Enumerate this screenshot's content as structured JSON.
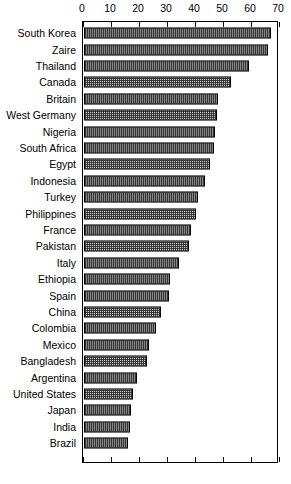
{
  "chart_data": {
    "type": "bar",
    "orientation": "horizontal",
    "title": "",
    "subtitle": "",
    "xlabel": "",
    "ylabel": "",
    "xlim": [
      0,
      70
    ],
    "ylim": null,
    "grid": false,
    "legend": null,
    "legend_position": "none",
    "axis_ticks_top": [
      0,
      10,
      20,
      30,
      40,
      50,
      60,
      70
    ],
    "axis_ticks_bottom_labeled": false,
    "tick_labels": [
      "0",
      "10",
      "20",
      "30",
      "40",
      "50",
      "60",
      "70"
    ],
    "bar_fill_color": "#c9c9c9",
    "bar_edge_color": "#000000",
    "categories": [
      "South Korea",
      "Zaire",
      "Thailand",
      "Canada",
      "Britain",
      "West Germany",
      "Nigeria",
      "South Africa",
      "Egypt",
      "Indonesia",
      "Turkey",
      "Philippines",
      "France",
      "Pakistan",
      "Italy",
      "Ethiopia",
      "Spain",
      "China",
      "Colombia",
      "Mexico",
      "Bangladesh",
      "Argentina",
      "United States",
      "Japan",
      "India",
      "Brazil"
    ],
    "values": [
      67.0,
      66.0,
      59.0,
      52.5,
      48.0,
      47.5,
      47.0,
      46.5,
      45.0,
      43.5,
      41.0,
      40.0,
      38.5,
      37.5,
      34.0,
      31.0,
      30.5,
      27.5,
      26.0,
      23.5,
      22.5,
      19.0,
      17.5,
      17.0,
      16.5,
      16.0
    ]
  }
}
